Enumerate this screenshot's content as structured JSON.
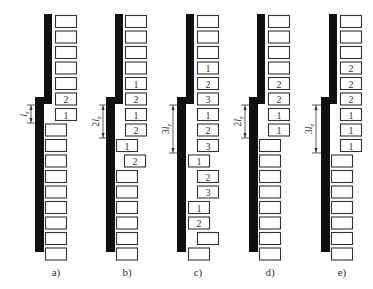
{
  "figure": {
    "width": 373,
    "height": 289,
    "colors": {
      "bar": "#111111",
      "box_stroke": "#333333",
      "text": "#333333"
    },
    "geometry": {
      "row_top": 15,
      "row_pitch": 15.5,
      "row_count": 16,
      "box_width": 21,
      "box_height": 12,
      "upper_bar": {
        "top": 14,
        "bottom": 104,
        "width": 8
      },
      "lower_bar": {
        "top": 97,
        "bottom": 252,
        "width": 9
      },
      "dim_top": 105
    },
    "panels": [
      {
        "id": "a",
        "caption": "a)",
        "upper_bar_x": 44,
        "lower_bar_x": 35,
        "dimension": {
          "label": "l",
          "coef": "",
          "sub": "z",
          "x": 31,
          "bottom": 123
        },
        "rows": [
          {
            "x": 55,
            "label": ""
          },
          {
            "x": 55,
            "label": ""
          },
          {
            "x": 55,
            "label": ""
          },
          {
            "x": 55,
            "label": ""
          },
          {
            "x": 55,
            "label": ""
          },
          {
            "x": 55,
            "label": "2"
          },
          {
            "x": 55,
            "label": "1"
          },
          {
            "x": 45,
            "label": ""
          },
          {
            "x": 45,
            "label": ""
          },
          {
            "x": 45,
            "label": ""
          },
          {
            "x": 45,
            "label": ""
          },
          {
            "x": 45,
            "label": ""
          },
          {
            "x": 45,
            "label": ""
          },
          {
            "x": 45,
            "label": ""
          },
          {
            "x": 45,
            "label": ""
          },
          {
            "x": 45,
            "label": ""
          }
        ]
      },
      {
        "id": "b",
        "caption": "b)",
        "upper_bar_x": 115,
        "lower_bar_x": 106,
        "dimension": {
          "label": "l",
          "coef": "2",
          "sub": "z",
          "x": 103,
          "bottom": 138
        },
        "rows": [
          {
            "x": 125,
            "label": ""
          },
          {
            "x": 125,
            "label": ""
          },
          {
            "x": 125,
            "label": ""
          },
          {
            "x": 125,
            "label": ""
          },
          {
            "x": 125,
            "label": "1"
          },
          {
            "x": 125,
            "label": "2"
          },
          {
            "x": 125,
            "label": "1"
          },
          {
            "x": 125,
            "label": "2"
          },
          {
            "x": 116,
            "label": "1"
          },
          {
            "x": 124,
            "label": "2"
          },
          {
            "x": 116,
            "label": ""
          },
          {
            "x": 116,
            "label": ""
          },
          {
            "x": 116,
            "label": ""
          },
          {
            "x": 116,
            "label": ""
          },
          {
            "x": 116,
            "label": ""
          },
          {
            "x": 116,
            "label": ""
          }
        ]
      },
      {
        "id": "c",
        "caption": "c)",
        "upper_bar_x": 186,
        "lower_bar_x": 177,
        "dimension": {
          "label": "l",
          "coef": "3",
          "sub": "z",
          "x": 173,
          "bottom": 153
        },
        "rows": [
          {
            "x": 197,
            "label": ""
          },
          {
            "x": 197,
            "label": ""
          },
          {
            "x": 197,
            "label": ""
          },
          {
            "x": 197,
            "label": "1"
          },
          {
            "x": 197,
            "label": "2"
          },
          {
            "x": 197,
            "label": "3"
          },
          {
            "x": 197,
            "label": "1"
          },
          {
            "x": 197,
            "label": "2"
          },
          {
            "x": 197,
            "label": "3"
          },
          {
            "x": 188,
            "label": "1"
          },
          {
            "x": 197,
            "label": "2"
          },
          {
            "x": 197,
            "label": "3"
          },
          {
            "x": 188,
            "label": "1"
          },
          {
            "x": 188,
            "label": "2"
          },
          {
            "x": 197,
            "label": ""
          },
          {
            "x": 188,
            "label": ""
          }
        ]
      },
      {
        "id": "d",
        "caption": "d)",
        "upper_bar_x": 257,
        "lower_bar_x": 249,
        "dimension": {
          "label": "l",
          "coef": "2",
          "sub": "z",
          "x": 245,
          "bottom": 138
        },
        "rows": [
          {
            "x": 268,
            "label": ""
          },
          {
            "x": 268,
            "label": ""
          },
          {
            "x": 268,
            "label": ""
          },
          {
            "x": 268,
            "label": ""
          },
          {
            "x": 268,
            "label": "2"
          },
          {
            "x": 268,
            "label": "2"
          },
          {
            "x": 268,
            "label": "1"
          },
          {
            "x": 268,
            "label": "1"
          },
          {
            "x": 259,
            "label": ""
          },
          {
            "x": 259,
            "label": ""
          },
          {
            "x": 259,
            "label": ""
          },
          {
            "x": 259,
            "label": ""
          },
          {
            "x": 259,
            "label": ""
          },
          {
            "x": 259,
            "label": ""
          },
          {
            "x": 259,
            "label": ""
          },
          {
            "x": 259,
            "label": ""
          }
        ]
      },
      {
        "id": "e",
        "caption": "e)",
        "upper_bar_x": 329,
        "lower_bar_x": 321,
        "dimension": {
          "label": "l",
          "coef": "3",
          "sub": "z",
          "x": 316,
          "bottom": 153
        },
        "rows": [
          {
            "x": 340,
            "label": ""
          },
          {
            "x": 340,
            "label": ""
          },
          {
            "x": 340,
            "label": ""
          },
          {
            "x": 340,
            "label": "2"
          },
          {
            "x": 340,
            "label": "2"
          },
          {
            "x": 340,
            "label": "2"
          },
          {
            "x": 340,
            "label": "1"
          },
          {
            "x": 340,
            "label": "1"
          },
          {
            "x": 340,
            "label": "1"
          },
          {
            "x": 331,
            "label": ""
          },
          {
            "x": 331,
            "label": ""
          },
          {
            "x": 331,
            "label": ""
          },
          {
            "x": 331,
            "label": ""
          },
          {
            "x": 331,
            "label": ""
          },
          {
            "x": 331,
            "label": ""
          },
          {
            "x": 331,
            "label": ""
          }
        ]
      }
    ]
  }
}
